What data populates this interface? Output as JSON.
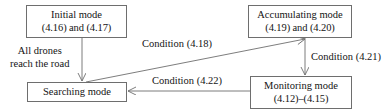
{
  "diagram": {
    "type": "state-transition-diagram",
    "background_color": "#ffffff",
    "line_color": "#6e6e6e",
    "text_color": "#141414",
    "nodes": [
      {
        "id": "initial",
        "name": "Initial mode",
        "label_line1": "Initial mode",
        "label_line2": "(4.16) and (4.17)"
      },
      {
        "id": "accumulating",
        "name": "Accumulating mode",
        "label_line1": "Accumulating mode",
        "label_line2": "(4.19) and (4.20)"
      },
      {
        "id": "searching",
        "name": "Searching mode",
        "label_line1": "Searching mode",
        "label_line2": ""
      },
      {
        "id": "monitoring",
        "name": "Monitoring mode",
        "label_line1": "Monitoring mode",
        "label_line2": "(4.12)–(4.15)"
      }
    ],
    "edges": [
      {
        "id": "initial-to-searching",
        "from": "Initial mode",
        "to": "Searching mode",
        "label_line1": "All drones",
        "label_line2": "reach the road"
      },
      {
        "id": "searching-to-accumulating",
        "from": "Searching mode",
        "to": "Accumulating mode",
        "label": "Condition (4.18)"
      },
      {
        "id": "accumulating-to-monitoring",
        "from": "Accumulating mode",
        "to": "Monitoring mode",
        "label": "Condition (4.21)"
      },
      {
        "id": "monitoring-to-searching",
        "from": "Monitoring mode",
        "to": "Searching mode",
        "label": "Condition (4.22)"
      }
    ]
  }
}
